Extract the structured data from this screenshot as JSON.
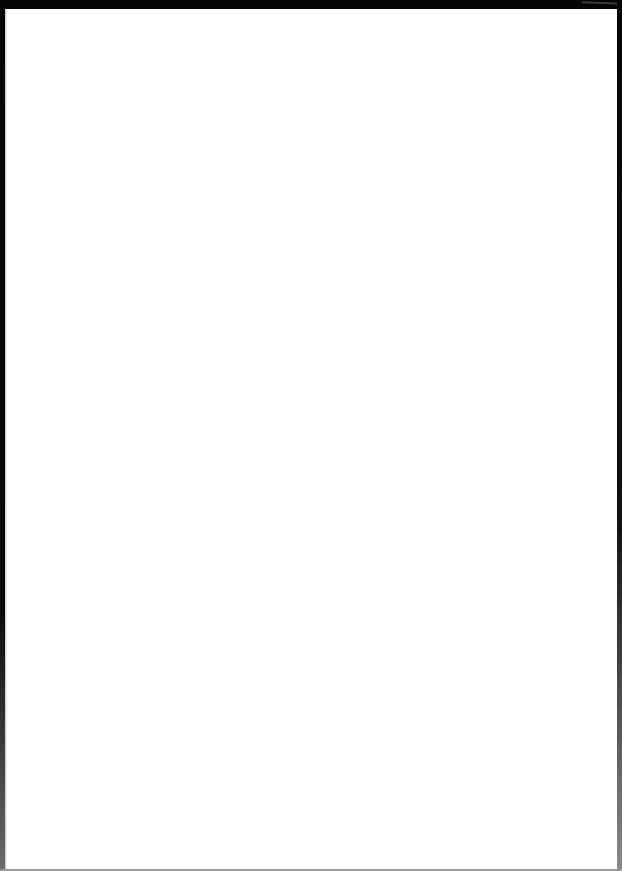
{
  "document": {
    "type": "scanned-page",
    "content": "",
    "colors": {
      "paper": "#ffffff",
      "scan_border": "#050505",
      "bottom_edge": "#9a9a9a"
    }
  }
}
